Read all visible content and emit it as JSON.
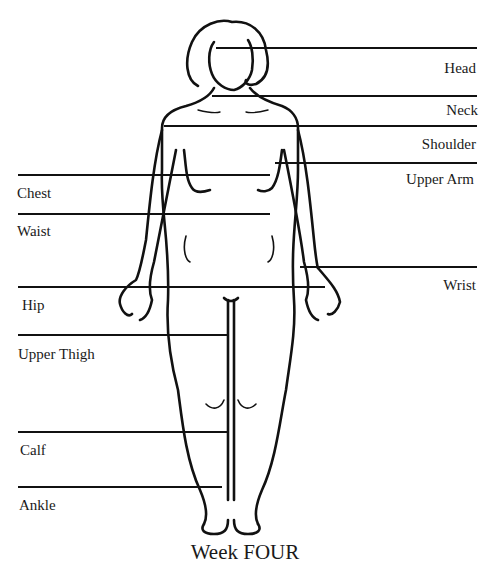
{
  "diagram": {
    "title": "Week FOUR",
    "measurement_labels": {
      "right": [
        {
          "id": "head",
          "label": "Head"
        },
        {
          "id": "neck",
          "label": "Neck"
        },
        {
          "id": "shoulder",
          "label": "Shoulder"
        },
        {
          "id": "upper_arm",
          "label": "Upper Arm"
        },
        {
          "id": "wrist",
          "label": "Wrist"
        }
      ],
      "left": [
        {
          "id": "chest",
          "label": "Chest"
        },
        {
          "id": "waist",
          "label": "Waist"
        },
        {
          "id": "hip",
          "label": "Hip"
        },
        {
          "id": "upper_thigh",
          "label": "Upper Thigh"
        },
        {
          "id": "calf",
          "label": "Calf"
        },
        {
          "id": "ankle",
          "label": "Ankle"
        }
      ]
    },
    "colors": {
      "line": "#111111",
      "background": "#ffffff"
    }
  }
}
